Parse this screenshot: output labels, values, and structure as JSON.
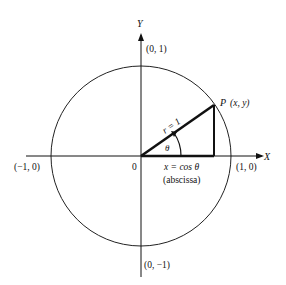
{
  "diagram": {
    "axes": {
      "x_label": "X",
      "y_label": "Y"
    },
    "points": {
      "top": "(0, 1)",
      "bottom": "(0, −1)",
      "left": "(−1, 0)",
      "right": "(1, 0)",
      "origin": "0",
      "p_letter": "P",
      "p_coords": "(x, y)"
    },
    "radius_label": "r = 1",
    "angle_label": "θ",
    "x_equation": "x = cos θ",
    "x_note": "(abscissa)",
    "colors": {
      "line": "#111111",
      "background": "#ffffff"
    }
  }
}
